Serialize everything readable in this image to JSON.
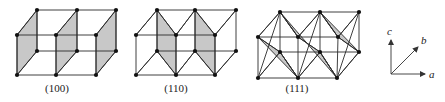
{
  "figure": {
    "panels": [
      {
        "label": "(100)",
        "label_pos": [
          57,
          92
        ],
        "nodes": {
          "ftl": [
            17,
            35
          ],
          "ftm": [
            56,
            35
          ],
          "ftr": [
            96,
            35
          ],
          "btl": [
            37,
            10
          ],
          "btm": [
            77,
            10
          ],
          "btr": [
            116,
            10
          ],
          "fbl": [
            17,
            75
          ],
          "fbm": [
            56,
            75
          ],
          "fbr": [
            96,
            75
          ],
          "bbl": [
            37,
            51
          ],
          "bbm": [
            77,
            51
          ],
          "bbr": [
            116,
            51
          ]
        },
        "planes": [
          [
            "ftl",
            "btl",
            "bbl",
            "fbl"
          ],
          [
            "ftm",
            "btm",
            "bbm",
            "fbm"
          ],
          [
            "ftr",
            "btr",
            "bbr",
            "fbr"
          ]
        ],
        "extra_edges": []
      },
      {
        "label": "(110)",
        "label_pos": [
          176,
          92
        ],
        "nodes": {
          "ftl": [
            136,
            35
          ],
          "ftm": [
            176,
            35
          ],
          "ftr": [
            215,
            35
          ],
          "btl": [
            157,
            10
          ],
          "btm": [
            195,
            10
          ],
          "btr": [
            236,
            10
          ],
          "fbl": [
            136,
            75
          ],
          "fbm": [
            176,
            75
          ],
          "fbr": [
            215,
            75
          ],
          "bbl": [
            157,
            51
          ],
          "bbm": [
            195,
            51
          ],
          "bbr": [
            236,
            51
          ]
        },
        "planes": [
          [
            "btl",
            "ftm",
            "fbm",
            "bbl"
          ],
          [
            "btm",
            "ftr",
            "fbr",
            "bbm"
          ]
        ],
        "extra_edges": [
          [
            "btl",
            "ftm"
          ],
          [
            "bbl",
            "fbm"
          ],
          [
            "btm",
            "ftr"
          ],
          [
            "bbm",
            "fbr"
          ],
          [
            "ftl",
            "btl"
          ],
          [
            "ftm",
            "btm"
          ],
          [
            "ftr",
            "btr"
          ],
          [
            "fbl",
            "bbl"
          ],
          [
            "fbm",
            "bbm"
          ],
          [
            "fbr",
            "bbr"
          ]
        ]
      },
      {
        "label": "(111)",
        "label_pos": [
          297,
          92
        ],
        "nodes": {
          "ftl": [
            258,
            37
          ],
          "ftm": [
            298,
            37
          ],
          "ftr": [
            338,
            37
          ],
          "btl": [
            280,
            12
          ],
          "btm": [
            320,
            12
          ],
          "btr": [
            359,
            12
          ],
          "fbl": [
            258,
            78
          ],
          "fbm": [
            298,
            78
          ],
          "fbr": [
            337,
            78
          ],
          "bbl": [
            280,
            52
          ],
          "bbm": [
            320,
            52
          ],
          "bbr": [
            359,
            52
          ]
        },
        "planes": [
          [
            "ftl",
            "bbl",
            "fbm"
          ],
          [
            "btl",
            "ftm",
            "bbm",
            "fbr"
          ],
          [
            "btm",
            "ftr",
            "bbr"
          ]
        ],
        "extra_edges": [
          [
            "ftl",
            "btl"
          ],
          [
            "ftm",
            "btl"
          ],
          [
            "ftm",
            "btm"
          ],
          [
            "ftr",
            "btm"
          ],
          [
            "ftr",
            "btr"
          ],
          [
            "fbl",
            "bbl"
          ],
          [
            "fbm",
            "bbl"
          ],
          [
            "fbm",
            "bbm"
          ],
          [
            "fbr",
            "bbm"
          ],
          [
            "fbr",
            "bbr"
          ],
          [
            "ftl",
            "bbl"
          ],
          [
            "ftm",
            "bbm"
          ],
          [
            "ftr",
            "bbr"
          ],
          [
            "btl",
            "ftm"
          ],
          [
            "btm",
            "ftr"
          ],
          [
            "fbl",
            "btl"
          ],
          [
            "bbl",
            "fbm"
          ],
          [
            "fbm",
            "btm"
          ],
          [
            "bbm",
            "fbr"
          ],
          [
            "fbr",
            "btr"
          ]
        ]
      }
    ],
    "axes": {
      "origin": [
        391,
        74
      ],
      "a": {
        "label": "a",
        "tip": [
          425,
          74
        ],
        "label_pos": [
          429,
          78
        ]
      },
      "b": {
        "label": "b",
        "tip": [
          418,
          47
        ],
        "label_pos": [
          421,
          44
        ]
      },
      "c": {
        "label": "c",
        "tip": [
          391,
          40
        ],
        "label_pos": [
          387,
          35
        ]
      }
    },
    "colors": {
      "plane_fill": "#c8c8c8",
      "line": "#2a2a2a",
      "node": "#111111"
    }
  }
}
